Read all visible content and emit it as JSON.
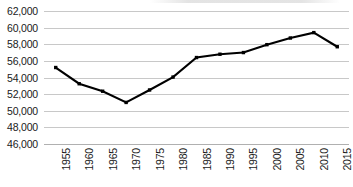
{
  "chart_data": {
    "type": "line",
    "title": "",
    "subtitle": "",
    "xlabel": "",
    "ylabel": "",
    "x": [
      1955,
      1960,
      1965,
      1970,
      1975,
      1980,
      1985,
      1990,
      1995,
      2000,
      2005,
      2010,
      2015
    ],
    "categories": [
      "1955",
      "1960",
      "1965",
      "1970",
      "1975",
      "1980",
      "1985",
      "1990",
      "1995",
      "2000",
      "2005",
      "2010",
      "2015"
    ],
    "values": [
      55200,
      53250,
      52350,
      51000,
      52500,
      54050,
      56400,
      56800,
      57000,
      57950,
      58750,
      59400,
      57700
    ],
    "series": [
      {
        "name": "",
        "values": [
          55200,
          53250,
          52350,
          51000,
          52500,
          54050,
          56400,
          56800,
          57000,
          57950,
          58750,
          59400,
          57700
        ]
      }
    ],
    "ylim": [
      46000,
      62000
    ],
    "ytick_step": 2000,
    "ytick_labels": [
      "62,000",
      "60,000",
      "58,000",
      "56,000",
      "54,000",
      "52,000",
      "50,000",
      "48,000",
      "46,000"
    ],
    "ytick_values": [
      62000,
      60000,
      58000,
      56000,
      54000,
      52000,
      50000,
      48000,
      46000
    ],
    "xtick_labels": [
      "1955",
      "1960",
      "1965",
      "1970",
      "1975",
      "1980",
      "1985",
      "1990",
      "1995",
      "2000",
      "2005",
      "2010",
      "2015"
    ],
    "xtick_rotation": -90,
    "grid": true,
    "grid_axis": "y",
    "legend": false,
    "legend_position": "none",
    "marker": "square",
    "line_color": "#000000",
    "marker_color": "#000000",
    "grid_color": "#c8c8c8",
    "axis_color": "#b0b0b0",
    "background_color": "#ffffff",
    "annotations": []
  }
}
